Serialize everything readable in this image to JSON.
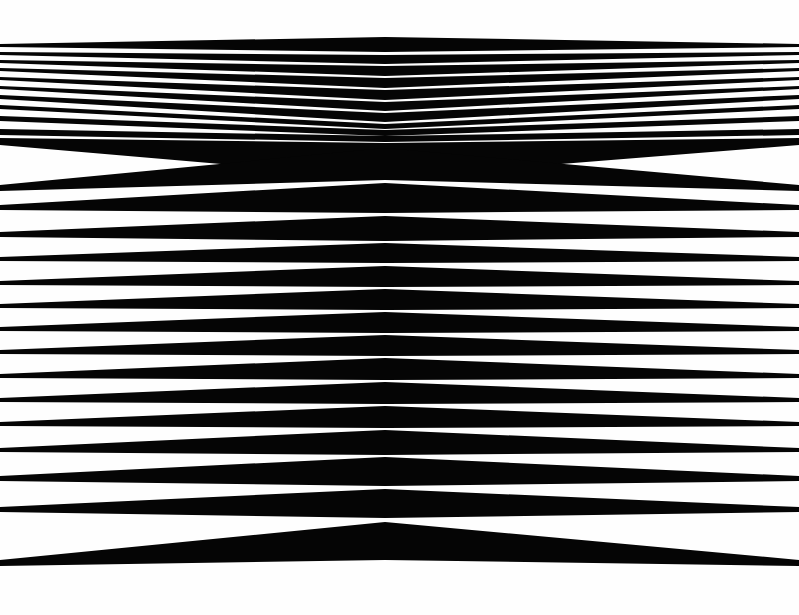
{
  "artwork": {
    "title": "Op Art Converging Wedge Bands",
    "style_label": "Optical art / geometric abstraction",
    "medium_label": "Black and white high-contrast print",
    "background_color": "#fefefe",
    "ink_color": "#050505",
    "canvas_width": 799,
    "canvas_height": 615,
    "center_x": 385,
    "left_edge_x": 0,
    "right_edge_x": 799,
    "band_count": 26,
    "symmetry": "bilateral vertical mirror about center axis",
    "description": "Horizontal black bands whose thickness varies from edge to center, converging to a vertical spine near the middle of the sheet, producing a pleated or folded-plane illusion."
  },
  "geometry": {
    "note": "Each band is a mirrored quadrilateral pair. edge_top/edge_bottom are y values at the left and right sheet edges; center_top/center_bottom are y values at the central spine.",
    "bands": [
      {
        "id": "band-01",
        "edge_top": 44,
        "edge_bottom": 47,
        "center_top": 37,
        "center_bottom": 52
      },
      {
        "id": "band-02",
        "edge_top": 52,
        "edge_bottom": 55,
        "center_top": 55,
        "center_bottom": 64
      },
      {
        "id": "band-03",
        "edge_top": 60,
        "edge_bottom": 63,
        "center_top": 66,
        "center_bottom": 76
      },
      {
        "id": "band-04",
        "edge_top": 68,
        "edge_bottom": 71,
        "center_top": 78,
        "center_bottom": 88
      },
      {
        "id": "band-05",
        "edge_top": 77,
        "edge_bottom": 80,
        "center_top": 90,
        "center_bottom": 100
      },
      {
        "id": "band-06",
        "edge_top": 86,
        "edge_bottom": 89,
        "center_top": 102,
        "center_bottom": 111
      },
      {
        "id": "band-07",
        "edge_top": 95,
        "edge_bottom": 99,
        "center_top": 113,
        "center_bottom": 122
      },
      {
        "id": "band-08",
        "edge_top": 105,
        "edge_bottom": 109,
        "center_top": 124,
        "center_bottom": 129
      },
      {
        "id": "band-09",
        "edge_top": 116,
        "edge_bottom": 121,
        "center_top": 130,
        "center_bottom": 136
      },
      {
        "id": "band-10",
        "edge_top": 129,
        "edge_bottom": 135,
        "center_top": 136,
        "center_bottom": 142
      },
      {
        "id": "band-11",
        "edge_top": 138,
        "edge_bottom": 145,
        "center_top": 143,
        "center_bottom": 178
      },
      {
        "id": "band-12",
        "edge_top": 185,
        "edge_bottom": 191,
        "center_top": 148,
        "center_bottom": 180
      },
      {
        "id": "band-13",
        "edge_top": 205,
        "edge_bottom": 210,
        "center_top": 183,
        "center_bottom": 213
      },
      {
        "id": "band-14",
        "edge_top": 232,
        "edge_bottom": 237,
        "center_top": 216,
        "center_bottom": 241
      },
      {
        "id": "band-15",
        "edge_top": 257,
        "edge_bottom": 261,
        "center_top": 243,
        "center_bottom": 263
      },
      {
        "id": "band-16",
        "edge_top": 281,
        "edge_bottom": 285,
        "center_top": 266,
        "center_bottom": 287
      },
      {
        "id": "band-17",
        "edge_top": 304,
        "edge_bottom": 308,
        "center_top": 289,
        "center_bottom": 310
      },
      {
        "id": "band-18",
        "edge_top": 327,
        "edge_bottom": 331,
        "center_top": 312,
        "center_bottom": 333
      },
      {
        "id": "band-19",
        "edge_top": 350,
        "edge_bottom": 354,
        "center_top": 335,
        "center_bottom": 356
      },
      {
        "id": "band-20",
        "edge_top": 374,
        "edge_bottom": 378,
        "center_top": 358,
        "center_bottom": 380
      },
      {
        "id": "band-21",
        "edge_top": 398,
        "edge_bottom": 402,
        "center_top": 382,
        "center_bottom": 404
      },
      {
        "id": "band-22",
        "edge_top": 422,
        "edge_bottom": 426,
        "center_top": 406,
        "center_bottom": 428
      },
      {
        "id": "band-23",
        "edge_top": 448,
        "edge_bottom": 452,
        "center_top": 430,
        "center_bottom": 455
      },
      {
        "id": "band-24",
        "edge_top": 476,
        "edge_bottom": 481,
        "center_top": 457,
        "center_bottom": 486
      },
      {
        "id": "band-25",
        "edge_top": 507,
        "edge_bottom": 512,
        "center_top": 489,
        "center_bottom": 518
      },
      {
        "id": "band-26",
        "edge_top": 560,
        "edge_bottom": 566,
        "center_top": 522,
        "center_bottom": 560
      }
    ]
  },
  "chart_data": {
    "type": "area",
    "title": "Op Art Converging Wedge Bands",
    "xlabel": "",
    "ylabel": "",
    "xlim": [
      0,
      799
    ],
    "ylim": [
      0,
      615
    ],
    "grid": false,
    "legend": "none",
    "categories": [
      "band-01",
      "band-02",
      "band-03",
      "band-04",
      "band-05",
      "band-06",
      "band-07",
      "band-08",
      "band-09",
      "band-10",
      "band-11",
      "band-12",
      "band-13",
      "band-14",
      "band-15",
      "band-16",
      "band-17",
      "band-18",
      "band-19",
      "band-20",
      "band-21",
      "band-22",
      "band-23",
      "band-24",
      "band-25",
      "band-26"
    ],
    "series": [
      {
        "name": "Edge thickness (px)",
        "values": [
          3,
          3,
          3,
          3,
          3,
          3,
          4,
          4,
          5,
          6,
          7,
          6,
          5,
          5,
          4,
          4,
          4,
          4,
          4,
          4,
          4,
          4,
          4,
          5,
          5,
          6
        ]
      },
      {
        "name": "Center thickness (px)",
        "values": [
          15,
          9,
          10,
          10,
          10,
          9,
          9,
          5,
          6,
          6,
          35,
          32,
          30,
          25,
          20,
          21,
          21,
          21,
          21,
          22,
          22,
          22,
          25,
          29,
          29,
          38
        ]
      }
    ]
  }
}
